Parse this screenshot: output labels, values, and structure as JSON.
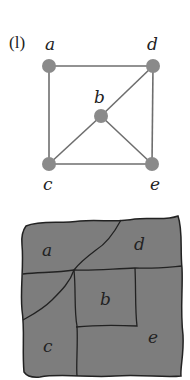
{
  "figure": {
    "panel_label": "(l)",
    "colors": {
      "node": "#8a8a8a",
      "edge": "#6e6e6e",
      "map_fill": "#7d7d7d",
      "map_border": "#222222"
    },
    "graph": {
      "nodes": [
        {
          "id": "a",
          "label": "a",
          "x": 49,
          "y": 66
        },
        {
          "id": "d",
          "label": "d",
          "x": 153,
          "y": 66
        },
        {
          "id": "b",
          "label": "b",
          "x": 101,
          "y": 116
        },
        {
          "id": "c",
          "label": "c",
          "x": 49,
          "y": 164
        },
        {
          "id": "e",
          "label": "e",
          "x": 152,
          "y": 164
        }
      ],
      "edges": [
        [
          "a",
          "d"
        ],
        [
          "a",
          "c"
        ],
        [
          "d",
          "e"
        ],
        [
          "c",
          "e"
        ],
        [
          "d",
          "b"
        ],
        [
          "b",
          "c"
        ],
        [
          "b",
          "e"
        ]
      ]
    },
    "map": {
      "regions": [
        {
          "id": "a",
          "label": "a"
        },
        {
          "id": "d",
          "label": "d"
        },
        {
          "id": "b",
          "label": "b"
        },
        {
          "id": "c",
          "label": "c"
        },
        {
          "id": "e",
          "label": "e"
        }
      ]
    }
  }
}
